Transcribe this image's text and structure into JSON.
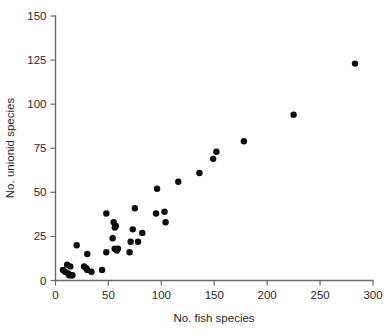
{
  "chart_data": {
    "type": "scatter",
    "title": "",
    "xlabel": "No. fish species",
    "ylabel": "No. unionid species",
    "xlim": [
      0,
      300
    ],
    "ylim": [
      0,
      150
    ],
    "xticks": [
      0,
      50,
      100,
      150,
      200,
      250,
      300
    ],
    "yticks": [
      0,
      25,
      50,
      75,
      100,
      125,
      150
    ],
    "xtick_labels": [
      "0",
      "50",
      "100",
      "150",
      "200",
      "250",
      "300"
    ],
    "ytick_labels": [
      "0",
      "25",
      "50",
      "75",
      "100",
      "125",
      "150"
    ],
    "grid": false,
    "legend": false,
    "marker": "filled-circle",
    "marker_color": "#0d0d0d",
    "marker_size": 3.2,
    "series": [
      {
        "name": "drainage basins",
        "points": [
          [
            7,
            6
          ],
          [
            9,
            5
          ],
          [
            11,
            9
          ],
          [
            12,
            4
          ],
          [
            13,
            3
          ],
          [
            14,
            8
          ],
          [
            15,
            3
          ],
          [
            16,
            3
          ],
          [
            20,
            20
          ],
          [
            27,
            8
          ],
          [
            29,
            7
          ],
          [
            30,
            15
          ],
          [
            30,
            6
          ],
          [
            34,
            5
          ],
          [
            44,
            6
          ],
          [
            48,
            38
          ],
          [
            48,
            16
          ],
          [
            54,
            24
          ],
          [
            55,
            33
          ],
          [
            56,
            18
          ],
          [
            56,
            30
          ],
          [
            57,
            31
          ],
          [
            58,
            17
          ],
          [
            59,
            18
          ],
          [
            70,
            16
          ],
          [
            71,
            22
          ],
          [
            73,
            29
          ],
          [
            75,
            41
          ],
          [
            78,
            22
          ],
          [
            82,
            27
          ],
          [
            95,
            38
          ],
          [
            96,
            52
          ],
          [
            103,
            39
          ],
          [
            104,
            33
          ],
          [
            116,
            56
          ],
          [
            136,
            61
          ],
          [
            149,
            69
          ],
          [
            152,
            73
          ],
          [
            178,
            79
          ],
          [
            225,
            94
          ],
          [
            283,
            123
          ]
        ]
      }
    ]
  },
  "figure": {
    "xlabel": "No. fish species",
    "ylabel": "No. unionid species"
  }
}
